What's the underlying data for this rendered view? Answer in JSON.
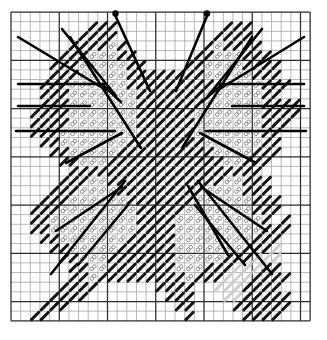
{
  "document": {
    "title": "Butterfly Cross-Stitch Chart",
    "type": "needlework-pattern-grid"
  },
  "grid": {
    "left": 11,
    "top": 12,
    "cell": 9.65,
    "columns": 31,
    "rows": 32,
    "minor_color": "#9a9a9a",
    "major_color": "#2b2b2b",
    "major_every": 5,
    "minor_width": 0.7,
    "major_width": 1.25,
    "background": "#ffffff"
  },
  "symbols": {
    "full_stitch": {
      "name": "solid-diagonal-stitch",
      "color": "#141414",
      "description": "solid dark diagonal stroke"
    },
    "light_stitch": {
      "name": "outline-loop-stitch",
      "color": "#8c8c8c",
      "description": "light grey open loop symbol"
    },
    "ghost_stitch": {
      "name": "faded-stitch",
      "color": "#cfcfcf",
      "description": "faded print artefact stitch"
    }
  },
  "backstitch": {
    "color": "#000000",
    "width": 2.6,
    "antenna_knob_radius": 3.2,
    "lines": [
      {
        "name": "antenna-left",
        "x1": 115.5,
        "y1": 16.0,
        "x2": 150.0,
        "y2": 91.0,
        "knob": [
          115.5,
          13.5
        ]
      },
      {
        "name": "antenna-right",
        "x1": 207.0,
        "y1": 16.0,
        "x2": 176.0,
        "y2": 91.0,
        "knob": [
          207.0,
          13.5
        ]
      },
      {
        "name": "uw-left-outer-diag",
        "x1": 18.0,
        "y1": 37.0,
        "x2": 106.0,
        "y2": 90.0
      },
      {
        "name": "uw-left-mid-diag",
        "x1": 62.0,
        "y1": 29.0,
        "x2": 116.0,
        "y2": 96.0
      },
      {
        "name": "uw-left-long-diag",
        "x1": 70.0,
        "y1": 37.0,
        "x2": 141.0,
        "y2": 148.0
      },
      {
        "name": "uw-left-bar-1",
        "x1": 18.0,
        "y1": 84.0,
        "x2": 104.0,
        "y2": 84.0
      },
      {
        "name": "uw-left-bar-2",
        "x1": 18.0,
        "y1": 106.0,
        "x2": 90.0,
        "y2": 106.0
      },
      {
        "name": "uw-left-bar-3",
        "x1": 16.0,
        "y1": 131.0,
        "x2": 115.0,
        "y2": 131.0
      },
      {
        "name": "uw-left-lower-diag",
        "x1": 66.0,
        "y1": 163.0,
        "x2": 122.0,
        "y2": 133.0
      },
      {
        "name": "uw-left-corner-diag",
        "x1": 104.0,
        "y1": 86.0,
        "x2": 121.0,
        "y2": 102.0
      },
      {
        "name": "uw-right-outer-diag",
        "x1": 304.0,
        "y1": 37.0,
        "x2": 218.0,
        "y2": 90.0
      },
      {
        "name": "uw-right-mid-diag",
        "x1": 262.0,
        "y1": 29.0,
        "x2": 208.0,
        "y2": 96.0
      },
      {
        "name": "uw-right-long-diag",
        "x1": 252.0,
        "y1": 37.0,
        "x2": 182.0,
        "y2": 148.0
      },
      {
        "name": "uw-right-bar-1",
        "x1": 304.0,
        "y1": 84.0,
        "x2": 220.0,
        "y2": 84.0
      },
      {
        "name": "uw-right-bar-2",
        "x1": 304.0,
        "y1": 106.0,
        "x2": 232.0,
        "y2": 106.0
      },
      {
        "name": "uw-right-bar-3",
        "x1": 306.0,
        "y1": 131.0,
        "x2": 206.0,
        "y2": 131.0
      },
      {
        "name": "uw-right-lower-diag",
        "x1": 256.0,
        "y1": 163.0,
        "x2": 200.0,
        "y2": 133.0
      },
      {
        "name": "uw-right-corner-diag",
        "x1": 220.0,
        "y1": 86.0,
        "x2": 202.0,
        "y2": 102.0
      },
      {
        "name": "lw-left-diag-1",
        "x1": 51.0,
        "y1": 274.0,
        "x2": 125.0,
        "y2": 181.0
      },
      {
        "name": "lw-left-diag-2",
        "x1": 78.0,
        "y1": 265.0,
        "x2": 128.0,
        "y2": 205.0
      },
      {
        "name": "lw-left-bar-diag",
        "x1": 56.0,
        "y1": 231.0,
        "x2": 122.0,
        "y2": 187.0
      },
      {
        "name": "lw-right-diag-1",
        "x1": 272.0,
        "y1": 274.0,
        "x2": 198.0,
        "y2": 181.0
      },
      {
        "name": "lw-right-diag-2",
        "x1": 245.0,
        "y1": 265.0,
        "x2": 195.0,
        "y2": 205.0
      },
      {
        "name": "lw-right-bar-diag",
        "x1": 267.0,
        "y1": 231.0,
        "x2": 201.0,
        "y2": 187.0
      },
      {
        "name": "lw-right-diag-3",
        "x1": 228.0,
        "y1": 255.0,
        "x2": 188.0,
        "y2": 186.0
      }
    ]
  },
  "chart_data": {
    "type": "heatmap",
    "xlabel": "",
    "ylabel": "",
    "legend": [
      "solid-diagonal-stitch",
      "outline-loop-stitch"
    ],
    "cols": 31,
    "rows": 32,
    "codes": {
      "0": "empty",
      "1": "solid-diagonal-stitch",
      "2": "outline-loop-stitch",
      "3": "faded-stitch"
    },
    "cells": [
      "...............................",
      "........111...........111......",
      ".......1111..........1111......",
      "......111121........121111.....",
      ".....11122211......11222111....",
      "....1112222211....1122221111...",
      "....111222221111111122222111...",
      "...11122222211111111122222111..",
      "...1112222222111111122222211...",
      "...111222222211111112222221111.",
      "..1111222222211111122222221111.",
      "..111122222221111112222222111..",
      "..11122222222111111222222211...",
      "...1122222221111111122222211...",
      "....112222211111111112222111...",
      ".....1122211111111111122111....",
      "......11111111111111111111.....",
      ".....1112211111111111122111....",
      "....11122221111111112222111....",
      "...1112222221111111222222111...",
      "..11122222222111112222222111...",
      "..1122222222211112222222221 1..",
      "..112222222221111222222222111..",
      "...1122222221111122222222111...",
      "....112222211111122222221113...",
      ".....11222111111122222111333...",
      "......1122111111122211133311...",
      "......11211111111121113331111..",
      ".....1111......1111..3331111...",
      "....1111........111...3311111..",
      "...111...........11....111111..",
      "..11..............1.....1111..."
    ]
  }
}
